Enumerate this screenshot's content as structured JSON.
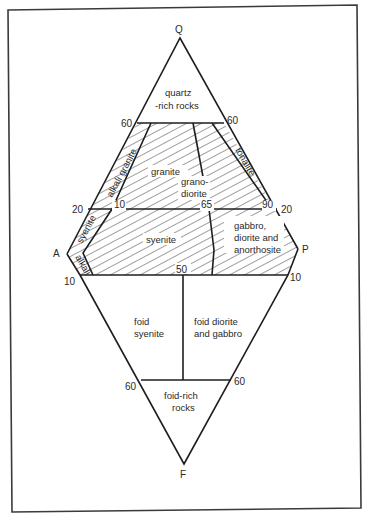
{
  "diagram": {
    "colors": {
      "line": "#1e1e1e",
      "hatch": "#2a2a2a",
      "background": "#ffffff",
      "frame": "#3a3a3a"
    },
    "vertices": {
      "q": "Q",
      "a": "A",
      "p": "P",
      "f": "F"
    },
    "ticks": {
      "q60_left": "60",
      "q60_right": "60",
      "q20_left": "20",
      "q20_right": "20",
      "a10_left": "10",
      "p10_right": "10",
      "f60_left": "60",
      "f60_right": "60",
      "inner_10": "10",
      "inner_65": "65",
      "inner_90": "90",
      "inner_50": "50"
    },
    "fields": {
      "quartz_rich_1": "quartz",
      "quartz_rich_2": "-rich rocks",
      "alkali_granite": "alkali granite",
      "granite": "granite",
      "granodiorite_1": "grano-",
      "granodiorite_2": "diorite",
      "tonalite": "tonalite",
      "syenite_alkali": "syenite",
      "syenite": "syenite",
      "alkali_feldspar": "alkali",
      "gabbro_1": "gabbro,",
      "gabbro_2": "diorite and",
      "gabbro_3": "anorthosite",
      "foid_syenite_1": "foid",
      "foid_syenite_2": "syenite",
      "foid_diorite_1": "foid diorite",
      "foid_diorite_2": "and gabbro",
      "foid_rich_1": "foid-rich",
      "foid_rich_2": "rocks"
    }
  }
}
